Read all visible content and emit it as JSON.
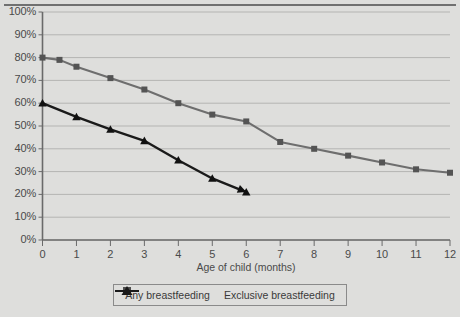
{
  "chart_data": {
    "type": "line",
    "title": "",
    "xlabel": "Age of child (months)",
    "ylabel": "",
    "xlim": [
      0,
      12
    ],
    "ylim": [
      0,
      100
    ],
    "grid": true,
    "legend_position": "bottom",
    "x_ticks": [
      "0",
      "1",
      "2",
      "3",
      "4",
      "5",
      "6",
      "7",
      "8",
      "9",
      "10",
      "11",
      "12"
    ],
    "y_ticks": [
      "0%",
      "10%",
      "20%",
      "30%",
      "40%",
      "50%",
      "60%",
      "70%",
      "80%",
      "90%",
      "100%"
    ],
    "series": [
      {
        "name": "Any breastfeeding",
        "color": "#6e6e6e",
        "marker": "square",
        "x": [
          0,
          0.5,
          1,
          2,
          3,
          4,
          5,
          6,
          7,
          8,
          9,
          10,
          11,
          12
        ],
        "values": [
          80,
          79,
          76,
          71,
          66,
          60,
          55,
          52,
          43,
          40,
          37,
          34,
          31,
          29.5
        ]
      },
      {
        "name": "Exclusive breastfeeding",
        "color": "#1a1a1a",
        "marker": "triangle",
        "x": [
          0,
          1,
          2,
          3,
          4,
          5,
          6
        ],
        "values": [
          60,
          54,
          48.5,
          43.5,
          35,
          27,
          21
        ]
      }
    ]
  },
  "legend": {
    "items": [
      {
        "label": "Any breastfeeding",
        "key_name": "legend-key-any-breastfeeding"
      },
      {
        "label": "Exclusive breastfeeding",
        "key_name": "legend-key-exclusive-breastfeeding"
      }
    ]
  },
  "axis": {
    "x_title": "Age of child (months)"
  },
  "colors": {
    "background": "#dededc",
    "grid": "#b4b4b2",
    "axis": "#6a6a6a",
    "series_any": "#6e6e6e",
    "series_exclusive": "#1a1a1a",
    "text": "#4a4a4a"
  }
}
